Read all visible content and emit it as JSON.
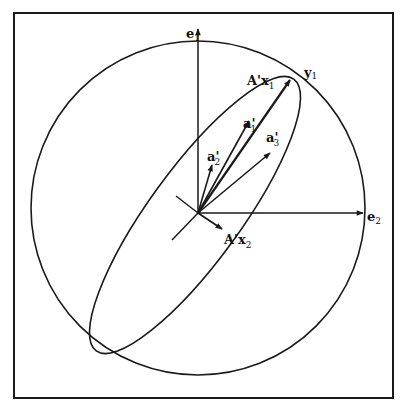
{
  "figure": {
    "frame": {
      "x1": 14,
      "y1": 13,
      "x2": 393,
      "y2": 398
    },
    "circle": {
      "cx": 198,
      "cy": 208,
      "r": 167
    },
    "origin": {
      "x": 198,
      "y": 213
    },
    "ellipse": {
      "cx": 195,
      "cy": 215,
      "rx": 168,
      "ry": 46,
      "rotate": -54
    },
    "colors": {
      "stroke": "#1a1a1a",
      "background": "#ffffff"
    },
    "axes": {
      "e1": {
        "label": "e",
        "sub": "1",
        "tip": {
          "x": 198,
          "y": 28
        }
      },
      "e2": {
        "label": "e",
        "sub": "2",
        "tip": {
          "x": 363,
          "y": 213
        }
      }
    },
    "major_axis_line": {
      "from": {
        "x": 172,
        "y": 240
      },
      "to": {
        "x": 292,
        "y": 77
      }
    },
    "minor_axis_line": {
      "from": {
        "x": 176,
        "y": 196
      },
      "to": {
        "x": 222,
        "y": 228
      }
    },
    "vectors": [
      {
        "id": "A'x1",
        "label": "A'x",
        "sub": "1",
        "tip": {
          "x": 290,
          "y": 80
        }
      },
      {
        "id": "a1'",
        "label": "a'",
        "sub": "1",
        "tip": {
          "x": 249,
          "y": 121
        }
      },
      {
        "id": "a3'",
        "label": "a'",
        "sub": "3",
        "tip": {
          "x": 270,
          "y": 153
        }
      },
      {
        "id": "a2'",
        "label": "a'",
        "sub": "2",
        "tip": {
          "x": 212,
          "y": 165
        }
      },
      {
        "id": "A'x2",
        "label": "A'x",
        "sub": "2",
        "tip": {
          "x": 222,
          "y": 228
        }
      }
    ],
    "labels": {
      "e1": {
        "main": "e",
        "sub": "1"
      },
      "e2": {
        "main": "e",
        "sub": "2"
      },
      "y1": {
        "main": "y",
        "sub": "1"
      },
      "Ax1": {
        "main": "A'x",
        "sub": "1"
      },
      "Ax2": {
        "main": "A'x",
        "sub": "2"
      },
      "a1": {
        "main": "a'",
        "sub": "1"
      },
      "a2": {
        "main": "a'",
        "sub": "2"
      },
      "a3": {
        "main": "a'",
        "sub": "3"
      }
    }
  }
}
